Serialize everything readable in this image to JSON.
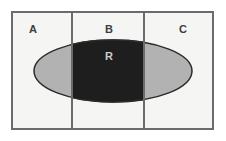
{
  "diagram": {
    "type": "set-region-diagram",
    "title": "",
    "canvas": {
      "width": 226,
      "height": 141,
      "background": "#ffffff"
    },
    "outer_rectangle": {
      "name": "universe-rectangle",
      "x": 11,
      "y": 11,
      "width": 203,
      "height": 119,
      "fill": "#f5f5f3",
      "stroke": "#6b6b6b",
      "stroke_width": 2
    },
    "columns": [
      {
        "id": "A",
        "label": "A",
        "x": 11,
        "width": 61,
        "label_x": 33,
        "label_y": 33
      },
      {
        "id": "B",
        "label": "B",
        "x": 72,
        "width": 72,
        "label_x": 109,
        "label_y": 33
      },
      {
        "id": "C",
        "label": "C",
        "x": 144,
        "width": 70,
        "label_x": 183,
        "label_y": 33
      }
    ],
    "dividers": [
      {
        "name": "divider-a-b",
        "x": 72
      },
      {
        "name": "divider-b-c",
        "x": 144
      }
    ],
    "ellipse": {
      "id": "R",
      "label": "R",
      "cx": 113,
      "cy": 71,
      "rx": 79,
      "ry": 31,
      "fill": "#b2b2b2",
      "stroke": "#2b2b2b",
      "stroke_width": 1.5,
      "label_x": 109,
      "label_y": 60,
      "label_color": "#cdcdcd"
    },
    "highlight": {
      "name": "intersection-R-and-B",
      "description": "R ∩ B",
      "fill": "#1e1e1e",
      "clip_x": 72,
      "clip_width": 72
    },
    "colors": {
      "background": "#ffffff",
      "panel": "#f5f5f3",
      "border": "#6b6b6b",
      "ellipse_fill": "#b2b2b2",
      "ellipse_stroke": "#2b2b2b",
      "intersection_fill": "#1e1e1e",
      "label_dark": "#3d3d3d",
      "label_light": "#cdcdcd"
    }
  }
}
